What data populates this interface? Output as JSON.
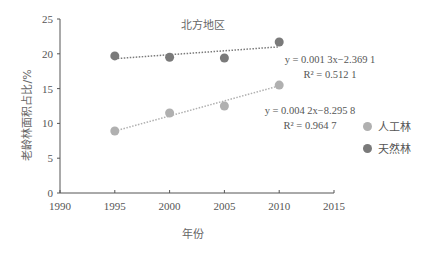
{
  "chart_data": {
    "type": "scatter",
    "title": "北方地区",
    "xlabel": "年份",
    "ylabel": "老龄林面积占比/%",
    "xlim": [
      1990,
      2015
    ],
    "ylim": [
      0,
      25
    ],
    "x_ticks": [
      "1990",
      "1995",
      "2000",
      "2005",
      "2010",
      "2015"
    ],
    "y_ticks": [
      "0",
      "5",
      "10",
      "15",
      "20",
      "25"
    ],
    "grid": false,
    "legend_position": "right",
    "series": [
      {
        "name": "人工林",
        "color": "#b0b0b0",
        "x": [
          1995,
          2000,
          2005,
          2010
        ],
        "y": [
          8.9,
          11.5,
          12.5,
          15.5
        ],
        "trendline": {
          "equation": "y = 0.004 2x−8.295 8",
          "r_squared": "R² = 0.964 7",
          "start": [
            1995,
            8.9
          ],
          "end": [
            2010,
            15.4
          ]
        }
      },
      {
        "name": "天然林",
        "color": "#7a7a7a",
        "x": [
          1995,
          2000,
          2005,
          2010
        ],
        "y": [
          19.7,
          19.5,
          19.4,
          21.7
        ],
        "trendline": {
          "equation": "y = 0.001 3x−2.369 1",
          "r_squared": "R² = 0.512 1",
          "start": [
            1995,
            19.3
          ],
          "end": [
            2010,
            21.0
          ]
        }
      }
    ]
  },
  "legend": {
    "items": [
      {
        "label": "人工林",
        "color": "#b0b0b0"
      },
      {
        "label": "天然林",
        "color": "#7a7a7a"
      }
    ]
  }
}
